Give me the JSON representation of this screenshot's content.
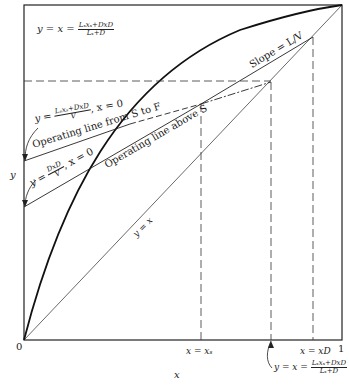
{
  "diagram": {
    "type": "McCabe-Thiele operating line diagram",
    "axes": {
      "x_label": "x",
      "y_label": "y",
      "origin_label": "0",
      "x_max_label": "1"
    },
    "curves": {
      "equilibrium": "equilibrium curve",
      "diagonal_label": "y = x"
    },
    "lines": {
      "upper_slope_label": "Slope = L/V",
      "op_line_s_to_f_label": "Operating line from S to F",
      "op_line_above_s_label": "Operating line above S"
    },
    "annotations": {
      "top_left_eq_prefix": "y = x =",
      "top_left_num": "Lₛxₛ+DxD",
      "top_left_den": "Lₛ+D",
      "intercept1_prefix": "y =",
      "intercept1_num": "Lₛxₛ+DxD",
      "intercept1_den": "V",
      "intercept1_suffix": ", x = 0",
      "intercept2_prefix": "y =",
      "intercept2_num": "DxD",
      "intercept2_den": "V",
      "intercept2_suffix": ", x = 0",
      "xs_label": "x = xₛ",
      "xd_label": "x = xD",
      "bottom_eq_prefix": "y = x =",
      "bottom_num": "Lₛxₛ+DxD",
      "bottom_den": "Lₛ+D"
    }
  }
}
